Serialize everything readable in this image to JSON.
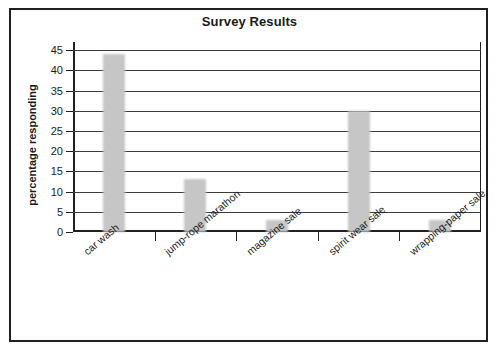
{
  "chart_data": {
    "type": "bar",
    "title": "Survey Results",
    "xlabel": "",
    "ylabel": "percentage responding",
    "categories": [
      "car wash",
      "jump-rope marathon",
      "magazine sale",
      "spirit wear sale",
      "wrapping-paper sale"
    ],
    "values": [
      44,
      13,
      3,
      30,
      3
    ],
    "ylim": [
      0,
      47
    ],
    "yticks": [
      0,
      5,
      10,
      15,
      20,
      25,
      30,
      35,
      40,
      45
    ],
    "ytick_labels": [
      "0",
      "5",
      "10",
      "15",
      "20",
      "25",
      "30",
      "35",
      "40",
      "45"
    ],
    "grid": "horizontal",
    "legend": "none",
    "bar_color": "#c6c6c6",
    "axis_color": "#231f20",
    "background": "#ffffff"
  }
}
